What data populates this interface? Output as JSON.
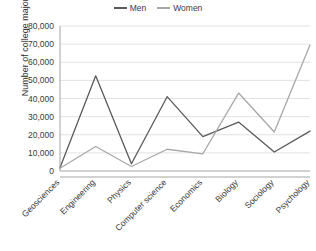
{
  "chart_data": {
    "type": "line",
    "title": "",
    "xlabel": "",
    "ylabel": "Number of college majors",
    "ylim": [
      0,
      80000
    ],
    "ytick_labels": [
      "80,000",
      "70,000",
      "60,000",
      "50,000",
      "40,000",
      "30,000",
      "20,000",
      "10,000",
      "0"
    ],
    "ytick_values": [
      80000,
      70000,
      60000,
      50000,
      40000,
      30000,
      20000,
      10000,
      0
    ],
    "grid": true,
    "legend_position": "top-center",
    "categories": [
      "Geosciences",
      "Engineering",
      "Physics",
      "Computer science",
      "Economics",
      "Biology",
      "Sociology",
      "Psychology"
    ],
    "series": [
      {
        "name": "Men",
        "color": "#5a5a5a",
        "values": [
          1800,
          52500,
          4000,
          41000,
          19000,
          27000,
          10500,
          22000
        ]
      },
      {
        "name": "Women",
        "color": "#a8a8a8",
        "values": [
          1500,
          13500,
          2500,
          12000,
          9500,
          43000,
          21500,
          69500
        ]
      }
    ]
  },
  "legend": {
    "items": [
      {
        "label": "Men",
        "color": "#5a5a5a"
      },
      {
        "label": "Women",
        "color": "#a8a8a8"
      }
    ]
  }
}
